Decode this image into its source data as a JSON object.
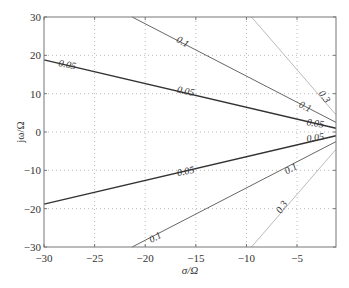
{
  "chart_data": {
    "type": "line",
    "title": "",
    "xlabel": "σ/Ω",
    "ylabel": "jω/Ω",
    "xlim": [
      -30,
      -1.15
    ],
    "ylim": [
      -30,
      30
    ],
    "xticks": [
      -30,
      -25,
      -20,
      -15,
      -10,
      -5
    ],
    "xtick_labels": [
      "−30",
      "−25",
      "−20",
      "−15",
      "−10",
      "−5"
    ],
    "yticks": [
      30,
      20,
      10,
      0,
      -10,
      -20,
      -30
    ],
    "ytick_labels": [
      "30",
      "20",
      "10",
      "0",
      "−10",
      "−20",
      "−30"
    ],
    "grid": true,
    "grid_style": "dotted",
    "series": [
      {
        "name": "0.05",
        "color": "#333333",
        "width": 1.4,
        "points": [
          [
            -30,
            18.8
          ],
          [
            -1.15,
            1.0
          ]
        ]
      },
      {
        "name": "0.05",
        "color": "#333333",
        "width": 1.4,
        "points": [
          [
            -30,
            -18.8
          ],
          [
            -1.15,
            -1.0
          ]
        ]
      },
      {
        "name": "0.1",
        "color": "#666666",
        "width": 1.0,
        "points": [
          [
            -21.3,
            30
          ],
          [
            -1.15,
            2.5
          ]
        ]
      },
      {
        "name": "0.1",
        "color": "#666666",
        "width": 1.0,
        "points": [
          [
            -21.3,
            -30
          ],
          [
            -1.15,
            -2.5
          ]
        ]
      },
      {
        "name": "0.3",
        "color": "#bbbbbb",
        "width": 1.0,
        "points": [
          [
            -9.5,
            30
          ],
          [
            -1.15,
            4.5
          ]
        ]
      },
      {
        "name": "0.3",
        "color": "#bbbbbb",
        "width": 1.0,
        "points": [
          [
            -9.5,
            -30
          ],
          [
            -1.15,
            -4.5
          ]
        ]
      }
    ],
    "annotations": [
      {
        "text": "0.05",
        "x": -27.7,
        "y": 17.5,
        "angle": 12
      },
      {
        "text": "0.05",
        "x": -16.0,
        "y": 10.6,
        "angle": 12
      },
      {
        "text": "0.05",
        "x": -3.2,
        "y": 2.2,
        "angle": 8
      },
      {
        "text": "0.05",
        "x": -3.2,
        "y": -1.5,
        "angle": -8
      },
      {
        "text": "0.05",
        "x": -16.0,
        "y": -10.3,
        "angle": -12
      },
      {
        "text": "0.1",
        "x": -16.3,
        "y": 23.5,
        "angle": 28
      },
      {
        "text": "0.1",
        "x": -4.2,
        "y": 6.6,
        "angle": 25
      },
      {
        "text": "0.1",
        "x": -5.6,
        "y": -9.6,
        "angle": -28
      },
      {
        "text": "0.1",
        "x": -19.0,
        "y": -27.5,
        "angle": -28
      },
      {
        "text": "0.3",
        "x": -2.3,
        "y": 9.2,
        "angle": 55
      },
      {
        "text": "0.3",
        "x": -6.5,
        "y": -19.6,
        "angle": -55
      }
    ]
  }
}
